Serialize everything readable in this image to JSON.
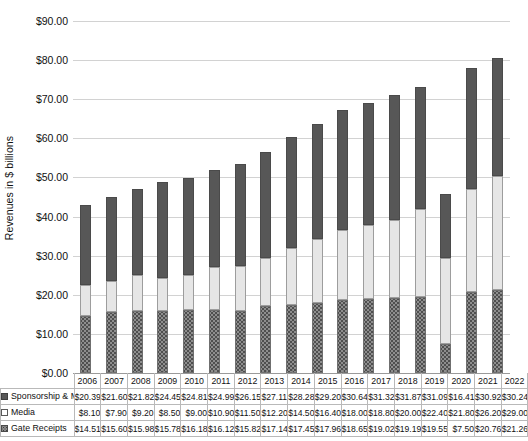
{
  "chart_data": {
    "type": "bar",
    "subtype": "stacked-column",
    "title": "",
    "xlabel": "",
    "ylabel": "Revenues in $ billions",
    "ylim": [
      0,
      90
    ],
    "ytick_step": 10,
    "ytick_labels": [
      "$0.00",
      "$10.00",
      "$20.00",
      "$30.00",
      "$40.00",
      "$50.00",
      "$60.00",
      "$70.00",
      "$80.00",
      "$90.00"
    ],
    "grid": true,
    "legend_position": "bottom-table",
    "categories": [
      "2006",
      "2007",
      "2008",
      "2009",
      "2010",
      "2011",
      "2012",
      "2013",
      "2014",
      "2015",
      "2016",
      "2017",
      "2018",
      "2019",
      "2020",
      "2021",
      "2022"
    ],
    "stack_order_bottom_to_top": [
      "Gate Receipts",
      "Media",
      "Sponsorship & Merchandising"
    ],
    "series": [
      {
        "name": "Sponsorship & Merchandising",
        "swatch": "sw-sponsorship",
        "color": "#575757",
        "values": [
          20.39,
          21.6,
          21.82,
          24.45,
          24.81,
          24.99,
          26.15,
          27.11,
          28.28,
          29.2,
          30.64,
          31.32,
          31.87,
          31.09,
          16.41,
          30.92,
          30.24
        ],
        "labels": [
          "$20.39",
          "$21.60",
          "$21.82",
          "$24.45",
          "$24.81",
          "$24.99",
          "$26.15",
          "$27.11",
          "$28.28",
          "$29.20",
          "$30.64",
          "$31.32",
          "$31.87",
          "$31.09",
          "$16.41",
          "$30.92",
          "$30.24"
        ]
      },
      {
        "name": "Media",
        "swatch": "sw-media",
        "color": "#e6e6e6",
        "values": [
          8.1,
          7.9,
          9.2,
          8.5,
          9.0,
          10.9,
          11.5,
          12.2,
          14.5,
          16.4,
          18.0,
          18.8,
          20.0,
          22.4,
          21.8,
          26.2,
          29.0
        ],
        "labels": [
          "$8.10",
          "$7.90",
          "$9.20",
          "$8.50",
          "$9.00",
          "$10.90",
          "$11.50",
          "$12.20",
          "$14.50",
          "$16.40",
          "$18.00",
          "$18.80",
          "$20.00",
          "$22.40",
          "$21.80",
          "$26.20",
          "$29.00"
        ]
      },
      {
        "name": "Gate Receipts",
        "swatch": "sw-gate",
        "color": "#8e8e8e",
        "values": [
          14.51,
          15.6,
          15.98,
          15.78,
          16.18,
          16.12,
          15.82,
          17.14,
          17.45,
          17.96,
          18.65,
          19.02,
          19.19,
          19.55,
          7.5,
          20.76,
          21.26
        ],
        "labels": [
          "$14.51",
          "$15.60",
          "$15.98",
          "$15.78",
          "$16.18",
          "$16.12",
          "$15.82",
          "$17.14",
          "$17.45",
          "$17.96",
          "$18.65",
          "$19.02",
          "$19.19",
          "$19.55",
          "$7.50",
          "$20.76",
          "$21.26"
        ]
      }
    ],
    "totals": [
      42.99,
      45.1,
      47.0,
      48.73,
      50.0,
      52.01,
      53.48,
      56.45,
      60.24,
      63.56,
      67.29,
      69.14,
      71.06,
      73.04,
      45.71,
      77.89,
      80.51
    ]
  }
}
